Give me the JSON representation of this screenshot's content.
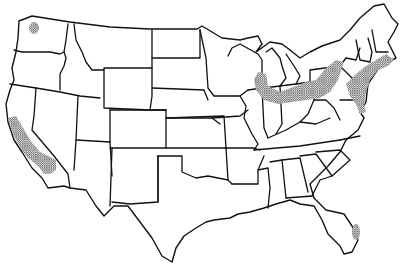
{
  "map": {
    "type": "outline-map",
    "subject": "Contiguous United States state outlines",
    "style": "black line art on white background",
    "colors": {
      "outline": "#111111",
      "background": "#ffffff",
      "stipple": "#333333"
    },
    "shaded_regions": [
      {
        "name": "Puget Sound area",
        "state": "Washington"
      },
      {
        "name": "Coastal California",
        "state": "California"
      },
      {
        "name": "Great Lakes industrial belt",
        "states": [
          "Illinois",
          "Indiana",
          "Michigan",
          "Ohio",
          "Pennsylvania",
          "New York"
        ]
      },
      {
        "name": "Northeast corridor",
        "states": [
          "Massachusetts",
          "Rhode Island",
          "Connecticut",
          "New York",
          "New Jersey",
          "Pennsylvania",
          "Delaware",
          "Maryland",
          "Virginia"
        ]
      },
      {
        "name": "Southeast Florida",
        "state": "Florida"
      }
    ],
    "legend": null,
    "labels": []
  }
}
